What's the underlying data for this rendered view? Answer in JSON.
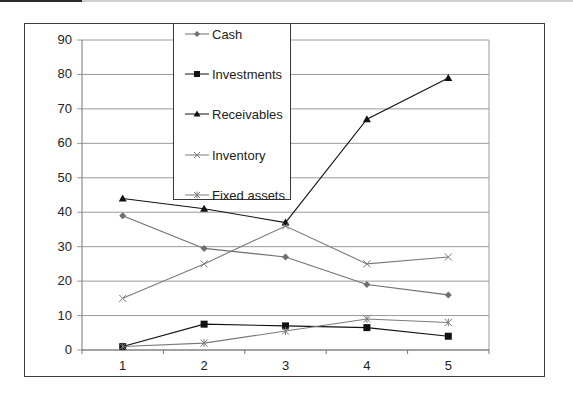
{
  "chart_data": {
    "type": "line",
    "title": "",
    "xlabel": "",
    "ylabel": "",
    "categories": [
      "1",
      "2",
      "3",
      "4",
      "5"
    ],
    "ylim": [
      0,
      90
    ],
    "yticks": [
      "0",
      "10",
      "20",
      "30",
      "40",
      "50",
      "60",
      "70",
      "80",
      "90"
    ],
    "grid": true,
    "legend_position": "upper-center (overlapping plot)",
    "series": [
      {
        "name": "Cash",
        "marker": "diamond",
        "color": "#6f6f6f",
        "values": [
          39,
          29.5,
          27,
          19,
          16
        ]
      },
      {
        "name": "Investments",
        "marker": "square",
        "color": "#111111",
        "values": [
          1,
          7.5,
          7,
          6.5,
          4
        ]
      },
      {
        "name": "Receivables",
        "marker": "triangle",
        "color": "#111111",
        "values": [
          44,
          41,
          37,
          67,
          79
        ]
      },
      {
        "name": "Inventory",
        "marker": "x",
        "color": "#7a7a7a",
        "values": [
          15,
          25,
          36,
          25,
          27
        ]
      },
      {
        "name": "Fixed assets",
        "marker": "star",
        "color": "#7a7a7a",
        "values": [
          1,
          2,
          5.5,
          9,
          8
        ]
      }
    ]
  },
  "legend": {
    "items": [
      {
        "label": "Cash"
      },
      {
        "label": "Investments"
      },
      {
        "label": "Receivables"
      },
      {
        "label": "Inventory"
      },
      {
        "label": "Fixed assets"
      }
    ]
  }
}
